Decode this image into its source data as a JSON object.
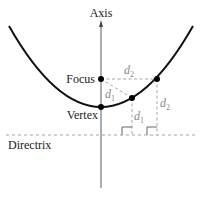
{
  "diagram": {
    "labels": {
      "axis": "Axis",
      "focus": "Focus",
      "vertex": "Vertex",
      "directrix": "Directrix",
      "d1_a": "d",
      "d1_a_sub": "1",
      "d1_b": "d",
      "d1_b_sub": "1",
      "d2_a": "d",
      "d2_a_sub": "2",
      "d2_b": "d",
      "d2_b_sub": "2"
    },
    "colors": {
      "curve": "#111111",
      "axis": "#777777",
      "dashed": "#9a9a9a",
      "label": "#222222",
      "distance_label": "#8a8a8a",
      "point": "#000000"
    },
    "points": {
      "focus": [
        101,
        79
      ],
      "vertex": [
        101,
        107
      ],
      "p1": [
        132,
        98
      ],
      "p2": [
        157,
        79
      ]
    },
    "directrix_y": 135
  }
}
